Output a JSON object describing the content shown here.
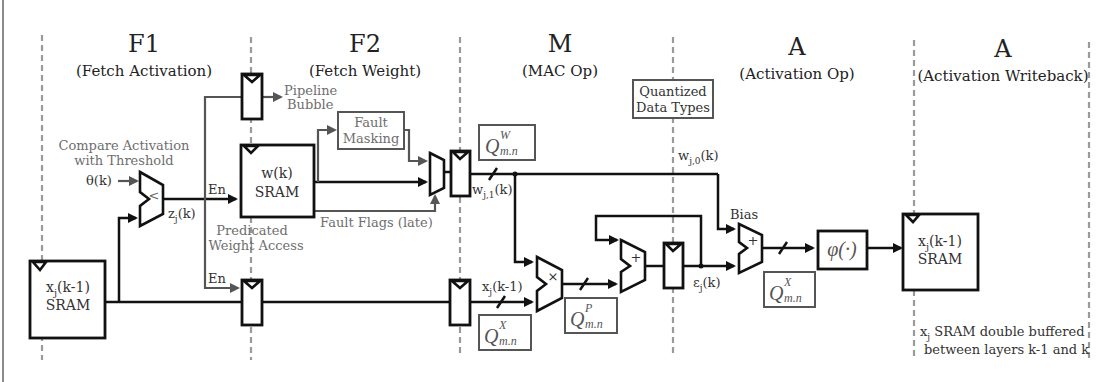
{
  "stages": [
    {
      "name": "F1",
      "subtitle": "(Fetch Activation)"
    },
    {
      "name": "F2",
      "subtitle": "(Fetch Weight)"
    },
    {
      "name": "M",
      "subtitle": "(MAC Op)"
    },
    {
      "name": "A",
      "subtitle": "(Activation Op)"
    },
    {
      "name": "A",
      "subtitle": "(Activation Writeback)"
    }
  ],
  "annotations": {
    "compare_line1": "Compare Activation",
    "compare_line2": "with Threshold",
    "theta": "θ(k)",
    "zj": "z",
    "zj_sub": "j",
    "zj_tail": "(k)",
    "en_top": "En",
    "en_bottom": "En",
    "pipeline_bubble_line1": "Pipeline",
    "pipeline_bubble_line2": "Bubble",
    "predicated_line1": "Predicated",
    "predicated_line2": "Weight Access",
    "fault_masking_line1": "Fault",
    "fault_masking_line2": "Masking",
    "fault_flags": "Fault Flags (late)",
    "quantized_line1": "Quantized",
    "quantized_line2": "Data Types",
    "wj1": "w",
    "wj1_sub": "j,1",
    "wj1_tail": "(k)",
    "wj0": "w",
    "wj0_sub": "j,0",
    "wj0_tail": "(k)",
    "xj_pipe": "x",
    "xj_pipe_sub": "j",
    "xj_pipe_tail": "(k-1)",
    "ej": "ε",
    "ej_sub": "j",
    "ej_tail": "(k)",
    "bias": "Bias",
    "double_buffer_line1_x": "x",
    "double_buffer_line1_sub": "j",
    "double_buffer_line1_tail": " SRAM double buffered",
    "double_buffer_line2": "between layers k-1 and k"
  },
  "blocks": {
    "input_sram": {
      "line1_x": "x",
      "line1_sub": "j",
      "line1_tail": "(k-1)",
      "line2": "SRAM"
    },
    "weight_sram": {
      "line1": "w(k)",
      "line2": "SRAM"
    },
    "output_sram": {
      "line1_x": "x",
      "line1_sub": "j",
      "line1_tail": "(k-1)",
      "line2": "SRAM"
    },
    "activation_fn": "φ(·)",
    "comparator_op": "<",
    "multiplier_op": "×",
    "accumulator_op": "+",
    "bias_adder_op": "+"
  },
  "quantization_labels": [
    {
      "id": "weight",
      "base": "Q",
      "sup": "W",
      "sub": "m.n"
    },
    {
      "id": "input",
      "base": "Q",
      "sup": "X",
      "sub": "m.n"
    },
    {
      "id": "product",
      "base": "Q",
      "sup": "P",
      "sub": "m.n"
    },
    {
      "id": "output",
      "base": "Q",
      "sup": "X",
      "sub": "m.n"
    }
  ]
}
